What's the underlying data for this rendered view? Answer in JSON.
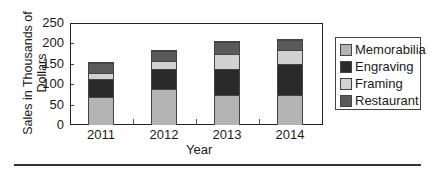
{
  "chart_data": {
    "type": "bar",
    "stacked": true,
    "title": "",
    "xlabel": "Year",
    "ylabel": "Sales in Thousands of Dollars",
    "ylim": [
      0,
      250
    ],
    "yticks": [
      0,
      50,
      100,
      150,
      200,
      250
    ],
    "categories": [
      "2011",
      "2012",
      "2013",
      "2014"
    ],
    "series": [
      {
        "name": "Memorabilia",
        "color": "#b4b4b4",
        "values": [
          70,
          90,
          75,
          75
        ]
      },
      {
        "name": "Engraving",
        "color": "#2a2a2a",
        "values": [
          45,
          50,
          65,
          75
        ]
      },
      {
        "name": "Framing",
        "color": "#d2d2d2",
        "values": [
          15,
          20,
          35,
          35
        ]
      },
      {
        "name": "Restaurant",
        "color": "#5a5a5a",
        "values": [
          25,
          25,
          30,
          25
        ]
      }
    ],
    "totals": [
      155,
      185,
      205,
      210
    ],
    "grid": false,
    "legend_position": "right"
  },
  "axis": {
    "ylabel_line1": "Sales in Thousands of",
    "ylabel_line2": "Dollars",
    "xlabel": "Year"
  },
  "legend": {
    "items": [
      {
        "label": "Memorabilia",
        "color": "#b4b4b4"
      },
      {
        "label": "Engraving",
        "color": "#2a2a2a"
      },
      {
        "label": "Framing",
        "color": "#d2d2d2"
      },
      {
        "label": "Restaurant",
        "color": "#5a5a5a"
      }
    ]
  }
}
